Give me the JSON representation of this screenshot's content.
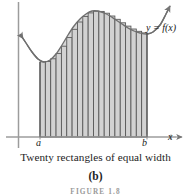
{
  "figure": {
    "caption": "Twenty rectangles of equal width",
    "panel_label": "(b)",
    "figure_number": "FIGURE 1.8",
    "curve_label": "y = f(x)",
    "axis": {
      "x_axis_label": "x",
      "left_bound_label": "a",
      "right_bound_label": "b"
    },
    "colors": {
      "curve": "#6b6b6b",
      "axis": "#9a9a9a",
      "rectangle_fill": "#d2d2d2",
      "rectangle_stroke": "#555555",
      "text": "#1a1a1a",
      "background": "#ffffff"
    }
  },
  "chart_data": {
    "type": "area",
    "title": "",
    "subtitle": "",
    "xlabel": "x",
    "ylabel": "",
    "grid": false,
    "legend": false,
    "annotations": [
      {
        "text": "y = f(x)",
        "x": 152,
        "y": 27
      },
      {
        "text": "a",
        "x": 40,
        "y": 144
      },
      {
        "text": "b",
        "x": 147,
        "y": 144
      },
      {
        "text": "x",
        "x": 171,
        "y": 137
      }
    ],
    "axis_geometry": {
      "x_axis_y": 137,
      "y_axis_x": 18.5,
      "x_axis_start": 6,
      "x_axis_end": 182,
      "y_axis_top": 2,
      "y_axis_bottom": 148
    },
    "interval": {
      "a": 40,
      "b": 147
    },
    "rectangle_count": 20,
    "rectangle_width": 5.35,
    "note": "Riemann sum with twenty inscribed rectangles of equal width over [a, b]",
    "curve_samples_px": [
      {
        "x": 20,
        "y": 34
      },
      {
        "x": 26,
        "y": 43
      },
      {
        "x": 32,
        "y": 52
      },
      {
        "x": 38,
        "y": 59
      },
      {
        "x": 44,
        "y": 62
      },
      {
        "x": 50,
        "y": 60
      },
      {
        "x": 56,
        "y": 54
      },
      {
        "x": 62,
        "y": 45
      },
      {
        "x": 68,
        "y": 35
      },
      {
        "x": 74,
        "y": 26
      },
      {
        "x": 80,
        "y": 19
      },
      {
        "x": 86,
        "y": 14
      },
      {
        "x": 92,
        "y": 11
      },
      {
        "x": 98,
        "y": 11
      },
      {
        "x": 104,
        "y": 13
      },
      {
        "x": 110,
        "y": 16
      },
      {
        "x": 116,
        "y": 20
      },
      {
        "x": 122,
        "y": 24
      },
      {
        "x": 128,
        "y": 28
      },
      {
        "x": 134,
        "y": 31
      },
      {
        "x": 140,
        "y": 33
      },
      {
        "x": 147,
        "y": 34
      },
      {
        "x": 153,
        "y": 32
      },
      {
        "x": 160,
        "y": 25
      },
      {
        "x": 166,
        "y": 14
      },
      {
        "x": 170,
        "y": 6
      }
    ],
    "rectangles": [
      {
        "index": 1,
        "x": 40.0,
        "top_y": 61.8
      },
      {
        "index": 2,
        "x": 45.35,
        "top_y": 61.4
      },
      {
        "index": 3,
        "x": 50.7,
        "top_y": 58.8
      },
      {
        "index": 4,
        "x": 56.05,
        "top_y": 53.6
      },
      {
        "index": 5,
        "x": 61.4,
        "top_y": 46.2
      },
      {
        "index": 6,
        "x": 66.75,
        "top_y": 37.6
      },
      {
        "index": 7,
        "x": 72.1,
        "top_y": 29.3
      },
      {
        "index": 8,
        "x": 77.45,
        "top_y": 22.0
      },
      {
        "index": 9,
        "x": 82.8,
        "top_y": 16.4
      },
      {
        "index": 10,
        "x": 88.15,
        "top_y": 12.9
      },
      {
        "index": 11,
        "x": 93.5,
        "top_y": 11.2
      },
      {
        "index": 12,
        "x": 98.85,
        "top_y": 11.4
      },
      {
        "index": 13,
        "x": 104.2,
        "top_y": 13.2
      },
      {
        "index": 14,
        "x": 109.55,
        "top_y": 16.0
      },
      {
        "index": 15,
        "x": 114.9,
        "top_y": 19.3
      },
      {
        "index": 16,
        "x": 120.25,
        "top_y": 22.8
      },
      {
        "index": 17,
        "x": 125.6,
        "top_y": 26.1
      },
      {
        "index": 18,
        "x": 130.95,
        "top_y": 29.0
      },
      {
        "index": 19,
        "x": 136.3,
        "top_y": 31.3
      },
      {
        "index": 20,
        "x": 141.65,
        "top_y": 32.9
      }
    ]
  }
}
